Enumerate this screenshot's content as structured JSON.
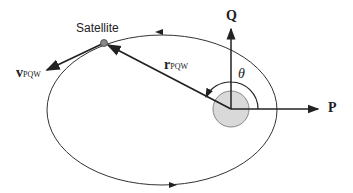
{
  "diagram": {
    "type": "orbit-perifocal-frame",
    "labels": {
      "satellite": "Satellite",
      "velocity_main": "v",
      "velocity_sub": "PQW",
      "position_main": "r",
      "position_sub": "PQW",
      "axis_q": "Q",
      "axis_p": "P",
      "true_anomaly": "θ"
    },
    "colors": {
      "line": "#222222",
      "earth_fill": "#d9d9d9",
      "earth_stroke": "#888888",
      "satellite_fill": "#888888"
    }
  }
}
